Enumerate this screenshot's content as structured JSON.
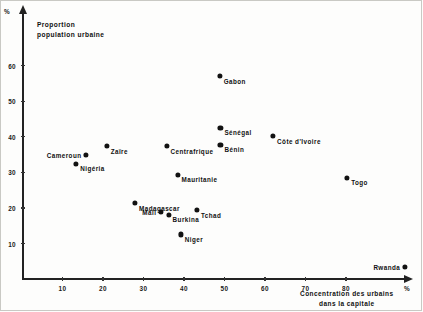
{
  "chart_data": {
    "type": "scatter",
    "title": "",
    "xlabel": "Concentration des urbains dans la capitale",
    "ylabel": "Proportion population urbaine",
    "xlabel_line1": "Concentration des urbains",
    "xlabel_line2": "dans la capitale",
    "ylabel_line1": "Proportion",
    "ylabel_line2": "population urbaine",
    "x_unit": "%",
    "y_unit": "%",
    "xlim": [
      0,
      95
    ],
    "ylim": [
      0,
      66
    ],
    "grid": false,
    "legend": "none",
    "xticks": [
      10,
      20,
      30,
      40,
      50,
      60,
      70,
      80
    ],
    "yticks": [
      10,
      20,
      30,
      40,
      50,
      60
    ],
    "xticklabels": [
      "10",
      "20",
      "30",
      "40",
      "50",
      "60",
      "70",
      "80"
    ],
    "yticklabels": [
      "10",
      "20",
      "30",
      "40",
      "50",
      "60"
    ],
    "points": [
      {
        "label": "Gabon",
        "x": 48.8,
        "y": 57.0,
        "label_side": "right"
      },
      {
        "label": "Sénégal",
        "x": 49.0,
        "y": 42.5,
        "label_side": "right"
      },
      {
        "label": "Côte d'Ivoire",
        "x": 62.0,
        "y": 40.2,
        "label_side": "right"
      },
      {
        "label": "Bénin",
        "x": 49.0,
        "y": 37.8,
        "label_side": "right"
      },
      {
        "label": "Zaïre",
        "x": 20.9,
        "y": 37.4,
        "label_side": "right"
      },
      {
        "label": "Centrafrique",
        "x": 35.7,
        "y": 37.4,
        "label_side": "right"
      },
      {
        "label": "Cameroun",
        "x": 15.8,
        "y": 35.0,
        "label_side": "left"
      },
      {
        "label": "Nigéria",
        "x": 13.4,
        "y": 32.5,
        "label_side": "right"
      },
      {
        "label": "Mauritanie",
        "x": 38.4,
        "y": 29.4,
        "label_side": "right"
      },
      {
        "label": "Togo",
        "x": 80.3,
        "y": 28.5,
        "label_side": "right"
      },
      {
        "label": "Madagascar",
        "x": 27.9,
        "y": 21.4,
        "label_side": "right"
      },
      {
        "label": "Tchad",
        "x": 43.2,
        "y": 19.4,
        "label_side": "right"
      },
      {
        "label": "Mali",
        "x": 34.3,
        "y": 19.0,
        "label_side": "left"
      },
      {
        "label": "Burkina",
        "x": 36.2,
        "y": 18.1,
        "label_side": "right"
      },
      {
        "label": "Niger",
        "x": 39.2,
        "y": 12.6,
        "label_side": "right"
      },
      {
        "label": "Rwanda",
        "x": 94.5,
        "y": 3.4,
        "label_side": "left"
      }
    ]
  }
}
